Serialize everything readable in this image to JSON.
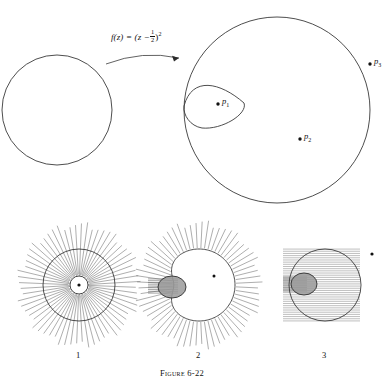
{
  "figure": {
    "caption": "Figure 6-22",
    "map_formula_parts": {
      "fz": "f(z)",
      "equals": "=",
      "open": "(z −",
      "frac_num": "1",
      "frac_den": "2",
      "close": ")",
      "exponent": "2"
    },
    "map_formula_plain": "f(z) = (z - 1/2)^2"
  },
  "top_diagram": {
    "source_circle": {
      "name": "source-circle",
      "cx": 57,
      "cy": 110,
      "r": 55
    },
    "image_outer_curve": {
      "name": "image-outer-curve",
      "cx": 277,
      "cy": 110,
      "r": 93
    },
    "image_inner_loop": {
      "name": "image-inner-loop",
      "cx": 214,
      "cy": 106,
      "rx": 30,
      "ry": 24
    },
    "arrow": {
      "name": "mapping-arrow",
      "from_x": 106,
      "from_y": 64,
      "to_x": 179,
      "to_y": 58
    },
    "points": [
      {
        "id": "p1",
        "label": "p",
        "sub": "1",
        "x": 218,
        "y": 104,
        "label_dx": 4,
        "label_dy": -4
      },
      {
        "id": "p2",
        "label": "p",
        "sub": "2",
        "x": 300,
        "y": 139,
        "label_dx": 4,
        "label_dy": -4
      },
      {
        "id": "p3",
        "label": "p",
        "sub": "3",
        "x": 370,
        "y": 64,
        "label_dx": 4,
        "label_dy": -4
      }
    ]
  },
  "panels": [
    {
      "id": "panel-1",
      "number": "1",
      "line_family": "radial",
      "cx": 79,
      "cy": 285,
      "outer_r": 42,
      "curve_r": 36,
      "inner_r": 9,
      "center_dot_r": 1.6,
      "ray_count": 64,
      "ray_inner": 9,
      "ray_outer": 60
    },
    {
      "id": "panel-2",
      "number": "2",
      "line_family": "radial-offset",
      "cx": 199,
      "cy": 285,
      "outer_r": 42,
      "curve_r": 36,
      "loop_cx": 172,
      "loop_cy": 287,
      "loop_rx": 14,
      "loop_ry": 11,
      "band_x": 148,
      "band_y": 278,
      "band_w": 30,
      "band_h": 16,
      "dot_x": 214,
      "dot_y": 276,
      "ray_count": 64,
      "ray_inner": 36,
      "ray_outer": 62
    },
    {
      "id": "panel-3",
      "number": "3",
      "line_family": "horizontal",
      "cx": 325,
      "cy": 285,
      "curve_r": 36,
      "loop_cx": 304,
      "loop_cy": 284,
      "loop_rx": 13,
      "loop_ry": 11,
      "hatch_x0": 283,
      "hatch_x1": 360,
      "hatch_y0": 248,
      "hatch_y1": 322,
      "hatch_count": 34,
      "band_x": 283,
      "band_y": 276,
      "band_w": 24,
      "band_h": 16,
      "dot_x": 372,
      "dot_y": 254
    }
  ],
  "colors": {
    "stroke": "#3a3a3a",
    "line": "#6b6b6b",
    "blob_fill": "#9a9a9a",
    "dot": "#111111",
    "background": "#ffffff"
  }
}
